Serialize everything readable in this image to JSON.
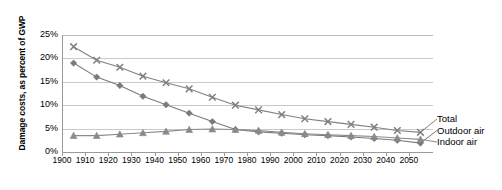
{
  "chart_data": {
    "type": "line",
    "title": "",
    "xlabel": "",
    "ylabel": "Damage costs, as percent of GWP",
    "xlim": [
      1900,
      2060
    ],
    "ylim": [
      0,
      25
    ],
    "ytick_labels": [
      "0%",
      "5%",
      "10%",
      "15%",
      "20%",
      "25%"
    ],
    "ytick_values": [
      0,
      5,
      10,
      15,
      20,
      25
    ],
    "xtick_labels": [
      "1900",
      "1910",
      "1920",
      "1930",
      "1940",
      "1950",
      "1960",
      "1970",
      "1980",
      "1990",
      "2000",
      "2010",
      "2020",
      "2030",
      "2040",
      "2050"
    ],
    "xtick_values": [
      1900,
      1910,
      1920,
      1930,
      1940,
      1950,
      1960,
      1970,
      1980,
      1990,
      2000,
      2010,
      2020,
      2030,
      2040,
      2050
    ],
    "grid": true,
    "legend_position": "right-of-plot-end",
    "x": [
      1905,
      1915,
      1925,
      1935,
      1945,
      1955,
      1965,
      1975,
      1985,
      1995,
      2005,
      2015,
      2025,
      2035,
      2045,
      2055
    ],
    "series": [
      {
        "name": "Total",
        "marker": "x",
        "color": "#808080",
        "values": [
          22.5,
          19.6,
          18.1,
          16.2,
          14.8,
          13.5,
          11.7,
          10.0,
          9.0,
          8.0,
          7.1,
          6.5,
          5.9,
          5.3,
          4.6,
          4.2
        ]
      },
      {
        "name": "Outdoor air",
        "marker": "diamond",
        "color": "#7a7a7a",
        "values": [
          19.0,
          16.0,
          14.2,
          11.9,
          10.1,
          8.3,
          6.5,
          4.8,
          4.3,
          4.0,
          3.7,
          3.5,
          3.2,
          2.9,
          2.5,
          1.9
        ]
      },
      {
        "name": "Indoor air",
        "marker": "triangle",
        "color": "#8a8a8a",
        "values": [
          3.5,
          3.5,
          3.8,
          4.1,
          4.4,
          4.8,
          4.9,
          4.8,
          4.6,
          4.2,
          3.9,
          3.7,
          3.5,
          3.3,
          3.0,
          2.7
        ]
      }
    ]
  },
  "legend": {
    "items": [
      {
        "label": "Total"
      },
      {
        "label": "Outdoor air"
      },
      {
        "label": "Indoor air"
      }
    ]
  },
  "axis": {
    "y_title": "Damage costs, as percent of GWP"
  },
  "colors": {
    "grid": "#c9c9c9",
    "axis": "#9a9a9a",
    "series_gray": "#808080",
    "background": "#ffffff"
  }
}
